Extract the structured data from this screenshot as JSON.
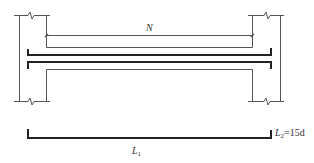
{
  "diagram": {
    "labels": {
      "clear_span": "N",
      "length_main": "L",
      "length_main_sub": "1",
      "length_hook": "L",
      "length_hook_sub": "2",
      "length_hook_value": "=15d"
    },
    "colors": {
      "thin_line": "#555555",
      "thick_line": "#222222",
      "background": "#ffffff"
    }
  }
}
